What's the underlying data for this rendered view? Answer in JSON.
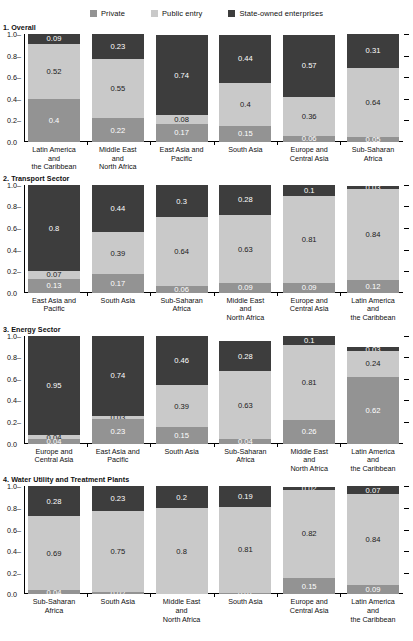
{
  "legend": {
    "items": [
      {
        "label": "Private",
        "color": "#939393",
        "key": "private"
      },
      {
        "label": "Public entry",
        "color": "#c9c9c9",
        "key": "public"
      },
      {
        "label": "State-owned enterprises",
        "color": "#3d3d3d",
        "key": "state"
      }
    ]
  },
  "axis": {
    "yticks": [
      "1.0",
      "0.8",
      "0.6",
      "0.4",
      "0.2",
      "0.0"
    ],
    "ylim": [
      0,
      1
    ]
  },
  "chart_data": [
    {
      "type": "bar",
      "title": "1. Overall",
      "stacked": true,
      "xlabel": "",
      "ylabel": "",
      "ylim": [
        0,
        1
      ],
      "grid": false,
      "legend_position": "top",
      "series": [
        {
          "name": "Private",
          "key": "private",
          "values": [
            0.4,
            0.22,
            0.17,
            0.15,
            0.06,
            0.05
          ]
        },
        {
          "name": "Public entry",
          "key": "public",
          "values": [
            0.52,
            0.55,
            0.08,
            0.4,
            0.36,
            0.64
          ]
        },
        {
          "name": "State-owned enterprises",
          "key": "state",
          "values": [
            0.09,
            0.23,
            0.74,
            0.44,
            0.57,
            0.31
          ]
        }
      ],
      "categories": [
        [
          "Latin America",
          "and",
          "the Caribbean"
        ],
        [
          "Middle East",
          "and",
          "North Africa"
        ],
        [
          "East Asia and",
          "Pacific"
        ],
        [
          "South Asia"
        ],
        [
          "Europe and",
          "Central Asia"
        ],
        [
          "Sub-Saharan",
          "Africa"
        ]
      ]
    },
    {
      "type": "bar",
      "title": "2. Transport Sector",
      "stacked": true,
      "xlabel": "",
      "ylabel": "",
      "ylim": [
        0,
        1
      ],
      "grid": false,
      "legend_position": "top",
      "series": [
        {
          "name": "Private",
          "key": "private",
          "values": [
            0.13,
            0.17,
            0.06,
            0.09,
            0.09,
            0.12
          ]
        },
        {
          "name": "Public entry",
          "key": "public",
          "values": [
            0.07,
            0.39,
            0.64,
            0.63,
            0.81,
            0.84
          ]
        },
        {
          "name": "State-owned enterprises",
          "key": "state",
          "values": [
            0.8,
            0.44,
            0.3,
            0.28,
            0.1,
            0.03
          ]
        }
      ],
      "categories": [
        [
          "East Asia and",
          "Pacific"
        ],
        [
          "South Asia"
        ],
        [
          "Sub-Saharan",
          "Africa"
        ],
        [
          "Middle East",
          "and",
          "North Africa"
        ],
        [
          "Europe and",
          "Central Asia"
        ],
        [
          "Latin America",
          "and",
          "the Caribbean"
        ]
      ]
    },
    {
      "type": "bar",
      "title": "3. Energy Sector",
      "stacked": true,
      "xlabel": "",
      "ylabel": "",
      "ylim": [
        0,
        1
      ],
      "grid": false,
      "legend_position": "top",
      "series": [
        {
          "name": "Private",
          "key": "private",
          "values": [
            0.04,
            0.23,
            0.15,
            0.04,
            0.26,
            0.62
          ]
        },
        {
          "name": "Public entry",
          "key": "public",
          "values": [
            0.04,
            0.03,
            0.39,
            0.63,
            0.81,
            0.24
          ]
        },
        {
          "name": "State-owned enterprises",
          "key": "state",
          "values": [
            0.95,
            0.74,
            0.46,
            0.28,
            0.1,
            0.03
          ]
        }
      ],
      "categories": [
        [
          "Europe and",
          "Central Asia"
        ],
        [
          "East Asia and",
          "Pacific"
        ],
        [
          "South Asia"
        ],
        [
          "Sub-Saharan",
          "Africa"
        ],
        [
          "Middle East",
          "and",
          "North Africa"
        ],
        [
          "Latin America",
          "and",
          "the Caribbean"
        ]
      ]
    },
    {
      "type": "bar",
      "title": "4. Water Utility and Treatment Plants",
      "stacked": true,
      "xlabel": "",
      "ylabel": "",
      "ylim": [
        0,
        1
      ],
      "grid": false,
      "legend_position": "top",
      "series": [
        {
          "name": "Private",
          "key": "private",
          "values": [
            0.04,
            0.02,
            null,
            0.01,
            0.15,
            0.09
          ]
        },
        {
          "name": "Public entry",
          "key": "public",
          "values": [
            0.69,
            0.75,
            0.8,
            0.81,
            0.82,
            0.84
          ]
        },
        {
          "name": "State-owned enterprises",
          "key": "state",
          "values": [
            0.28,
            0.23,
            0.2,
            0.19,
            0.02,
            0.07
          ]
        }
      ],
      "categories": [
        [
          "Sub-Saharan",
          "Africa"
        ],
        [
          "South Asia"
        ],
        [
          "Middle East",
          "and",
          "North Africa"
        ],
        [
          "South Asia"
        ],
        [
          "Europe and",
          "Central Asia"
        ],
        [
          "Latin America",
          "and",
          "the Caribbean"
        ]
      ]
    }
  ]
}
